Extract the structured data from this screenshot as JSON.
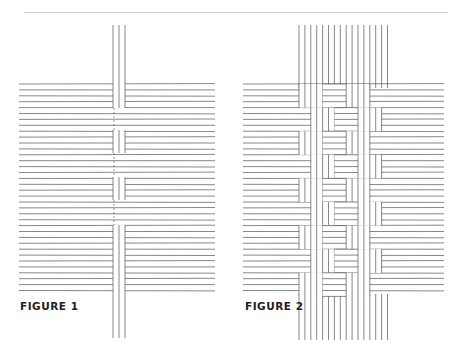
{
  "figures": [
    {
      "id": "fig1",
      "label": "FIGURE 1",
      "description": "Single vertical strand woven over/under horizontal strands"
    },
    {
      "id": "fig2",
      "label": "FIGURE 2",
      "description": "Twill weave pattern of vertical and horizontal strands"
    }
  ],
  "colors": {
    "line": "#555555",
    "rule": "#cfcfcf",
    "label": "#222222"
  }
}
